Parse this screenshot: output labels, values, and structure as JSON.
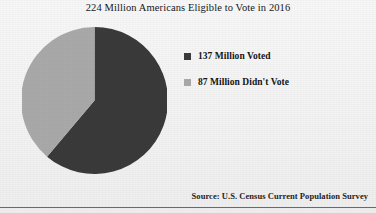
{
  "chart_data": {
    "type": "pie",
    "title": "224 Million Americans Eligible to Vote in 2016",
    "xlabel": "",
    "ylabel": "",
    "legend_position": "right",
    "grid": false,
    "total": 224,
    "units": "million people",
    "categories": [
      "137 Million Voted",
      "87 Million Didn't Vote"
    ],
    "values": [
      137,
      87
    ],
    "percentages": [
      61.2,
      38.8
    ],
    "colors": [
      "#3a3a3a",
      "#a9a9a9"
    ],
    "start_angle_deg": 0,
    "direction": "clockwise",
    "slices": [
      {
        "label": "137 Million Voted",
        "value": 137,
        "percent": 61.2,
        "color": "#3a3a3a",
        "start_deg": 0,
        "end_deg": 220.2
      },
      {
        "label": "87 Million Didn't Vote",
        "value": 87,
        "percent": 38.8,
        "color": "#a9a9a9",
        "start_deg": 220.2,
        "end_deg": 360
      }
    ],
    "annotations": [
      "Source:  U.S. Census Current Population Survey"
    ]
  },
  "figure": {
    "title": "224 Million Americans Eligible to Vote in 2016",
    "source_note": "Source:  U.S. Census Current Population Survey",
    "background_color": "#f3f3f3"
  },
  "legend": {
    "entries": [
      {
        "label": "137 Million Voted",
        "color": "#3a3a3a"
      },
      {
        "label": "87 Million Didn't Vote",
        "color": "#a9a9a9"
      }
    ]
  }
}
